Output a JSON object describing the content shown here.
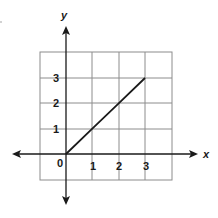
{
  "chart_data": {
    "type": "line",
    "title": "",
    "xlabel": "x",
    "ylabel": "y",
    "xlim": [
      -1,
      4
    ],
    "ylim": [
      -1,
      4
    ],
    "grid": true,
    "x_ticks": [
      "1",
      "2",
      "3"
    ],
    "y_ticks": [
      "1",
      "2",
      "3"
    ],
    "origin_label": "0",
    "series": [
      {
        "name": "line",
        "x": [
          0,
          1,
          2,
          3
        ],
        "y": [
          0,
          1,
          2,
          3
        ]
      }
    ],
    "colors": {
      "line": "#1a1a1a",
      "grid": "#8c8c8c",
      "axis": "#1a1a1a"
    }
  }
}
